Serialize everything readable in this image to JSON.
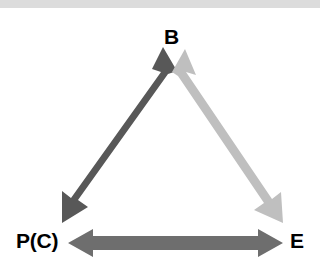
{
  "diagram": {
    "type": "triangle-relationship",
    "title_visible": false,
    "background_color": "#ffffff",
    "top_band": {
      "color": "#dcdcdc",
      "height_px": 8
    },
    "nodes": [
      {
        "id": "B",
        "label": "B",
        "position": "top",
        "x": 174,
        "y": 36
      },
      {
        "id": "P(C)",
        "label": "P(C)",
        "position": "bottom-left",
        "x": 40,
        "y": 242
      },
      {
        "id": "E",
        "label": "E",
        "position": "bottom-right",
        "x": 297,
        "y": 242
      }
    ],
    "edges": [
      {
        "id": "edge-b-pc",
        "from": "B",
        "to": "P(C)",
        "arrowheads": "both",
        "color": "#585858",
        "shade": "dark-gray"
      },
      {
        "id": "edge-b-e",
        "from": "B",
        "to": "E",
        "arrowheads": "both",
        "color": "#bfbfbf",
        "shade": "light-gray"
      },
      {
        "id": "edge-pc-e",
        "from": "P(C)",
        "to": "E",
        "arrowheads": "both",
        "color": "#6e6e6e",
        "shade": "medium-gray"
      }
    ]
  }
}
